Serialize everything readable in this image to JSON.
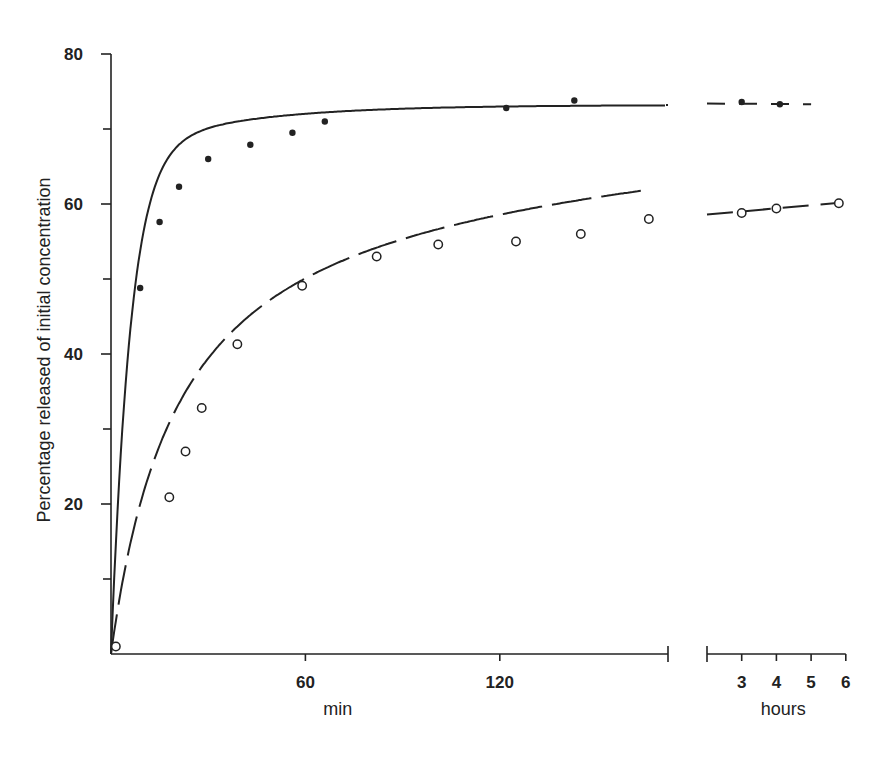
{
  "chart_data": {
    "type": "scatter",
    "title": "",
    "ylabel": "Percentage released of initial concentration",
    "xlabel": "min",
    "xlabel_secondary": "hours",
    "ylim": [
      0,
      80
    ],
    "yticks_major": [
      20,
      40,
      60,
      80
    ],
    "yticks_minor": [
      10,
      30,
      50,
      70
    ],
    "x_segments": [
      {
        "unit": "min",
        "range": [
          0,
          171
        ],
        "ticks": [
          60,
          120
        ],
        "tick_labels": [
          "60",
          "120"
        ]
      },
      {
        "unit": "hours",
        "range": [
          2,
          6
        ],
        "ticks": [
          3,
          4,
          5,
          6
        ],
        "tick_labels": [
          "3",
          "4",
          "5",
          "6"
        ]
      }
    ],
    "axis_break": true,
    "grid": false,
    "legend": null,
    "series": [
      {
        "name": "filled circles",
        "marker": "filled-circle",
        "line": "dash-dot fitted curve",
        "points_min": [
          [
            9,
            48.8
          ],
          [
            15,
            57.6
          ],
          [
            21,
            62.3
          ],
          [
            30,
            66.0
          ],
          [
            43,
            67.9
          ],
          [
            56,
            69.5
          ],
          [
            66,
            71.0
          ],
          [
            122,
            72.8
          ],
          [
            143,
            73.8
          ]
        ],
        "points_hours": [
          [
            3,
            73.6
          ],
          [
            4.1,
            73.3
          ]
        ],
        "curve_plateau": 73.2
      },
      {
        "name": "open circles",
        "marker": "open-circle",
        "line": "dashed fitted curve",
        "points_min": [
          [
            1.5,
            1.0
          ],
          [
            18,
            20.9
          ],
          [
            23,
            27.0
          ],
          [
            28,
            32.8
          ],
          [
            39,
            41.3
          ],
          [
            59,
            49.1
          ],
          [
            82,
            53.0
          ],
          [
            101,
            54.6
          ],
          [
            125,
            55.0
          ],
          [
            145,
            56.0
          ],
          [
            166,
            58.0
          ]
        ],
        "points_hours": [
          [
            3,
            58.8
          ],
          [
            4,
            59.4
          ],
          [
            5.8,
            60.1
          ]
        ]
      }
    ]
  }
}
